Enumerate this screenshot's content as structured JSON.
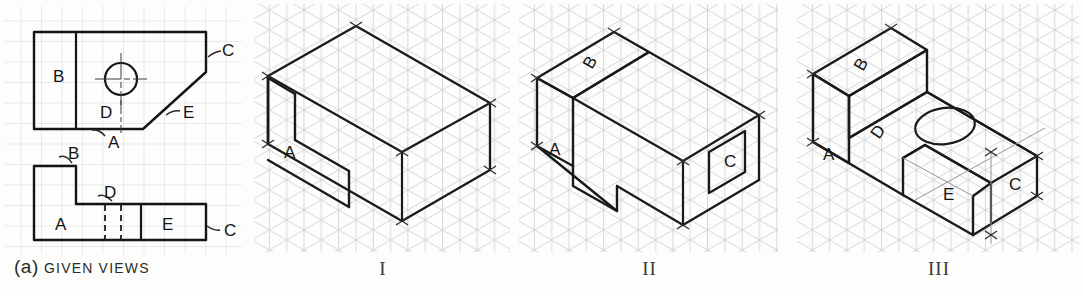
{
  "figure": {
    "background": "#fdfdfc",
    "ink": "#1c1c1c",
    "grid_color": "#c9cfd6"
  },
  "panels": [
    {
      "id": "given-views",
      "caption_prefix": "(a)",
      "caption_text": "GIVEN VIEWS",
      "grid": "square",
      "views": [
        {
          "name": "top-view",
          "labels": [
            {
              "text": "B",
              "x": 53,
              "y": 82
            },
            {
              "text": "D",
              "x": 106,
              "y": 114
            },
            {
              "text": "A",
              "x": 113,
              "y": 143
            },
            {
              "text": "C",
              "x": 216,
              "y": 60
            },
            {
              "text": "E",
              "x": 183,
              "y": 116
            }
          ]
        },
        {
          "name": "front-view",
          "labels": [
            {
              "text": "B",
              "x": 75,
              "y": 159
            },
            {
              "text": "D",
              "x": 114,
              "y": 195
            },
            {
              "text": "A",
              "x": 62,
              "y": 229
            },
            {
              "text": "E",
              "x": 163,
              "y": 229
            },
            {
              "text": "C",
              "x": 224,
              "y": 235
            }
          ]
        }
      ]
    },
    {
      "id": "pictorial-1",
      "caption_text": "I",
      "grid": "isometric",
      "labels": [
        {
          "text": "A",
          "x": 38,
          "y": 151
        }
      ]
    },
    {
      "id": "pictorial-2",
      "caption_text": "II",
      "grid": "isometric",
      "labels": [
        {
          "text": "B",
          "x": 75,
          "y": 63,
          "rotate": -60
        },
        {
          "text": "A",
          "x": 38,
          "y": 148
        },
        {
          "text": "C",
          "x": 222,
          "y": 190
        }
      ]
    },
    {
      "id": "pictorial-3",
      "caption_text": "III",
      "grid": "isometric",
      "labels": [
        {
          "text": "B",
          "x": 68,
          "y": 66,
          "rotate": -60
        },
        {
          "text": "A",
          "x": 32,
          "y": 154
        },
        {
          "text": "D",
          "x": 85,
          "y": 143,
          "rotate": -60
        },
        {
          "text": "E",
          "x": 150,
          "y": 195
        },
        {
          "text": "C",
          "x": 222,
          "y": 185
        }
      ],
      "features": [
        "through-hole-ellipse",
        "inclined-face-E"
      ]
    }
  ]
}
